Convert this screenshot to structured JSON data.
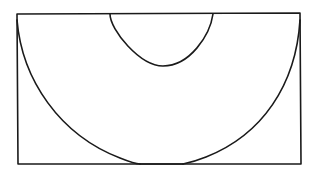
{
  "diagram": {
    "type": "geometric-figure",
    "colors": {
      "background": "#ffffff",
      "stroke": "#1a1a1a"
    },
    "shapes": {
      "rectangle": {
        "x1": 17,
        "y1": 14,
        "x2": 300,
        "y2": 164
      },
      "large_arc": {
        "start": [
          17,
          22
        ],
        "end": [
          300,
          22
        ],
        "bottom_y": 163
      },
      "small_arc": {
        "start": [
          110,
          14
        ],
        "end": [
          213,
          14
        ],
        "bottom_y": 66
      }
    }
  }
}
